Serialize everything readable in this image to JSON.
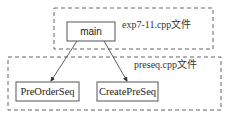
{
  "diagram": {
    "type": "call-graph",
    "groups": [
      {
        "id": "exp",
        "label": "exp7-11.cpp文件",
        "style": "dashed"
      },
      {
        "id": "preseq",
        "label": "preseq.cpp文件",
        "style": "dashed"
      }
    ],
    "nodes": [
      {
        "id": "main",
        "label": "main",
        "group": "exp"
      },
      {
        "id": "preorder",
        "label": "PreOrderSeq",
        "group": "preseq"
      },
      {
        "id": "create",
        "label": "CreatePreSeq",
        "group": "preseq"
      }
    ],
    "edges": [
      {
        "from": "main",
        "to": "PreOrderSeq"
      },
      {
        "from": "main",
        "to": "CreatePreSeq"
      }
    ],
    "colors": {
      "stroke": "#555555",
      "dash": "#666666",
      "text": "#222222",
      "background": "#ffffff"
    }
  }
}
